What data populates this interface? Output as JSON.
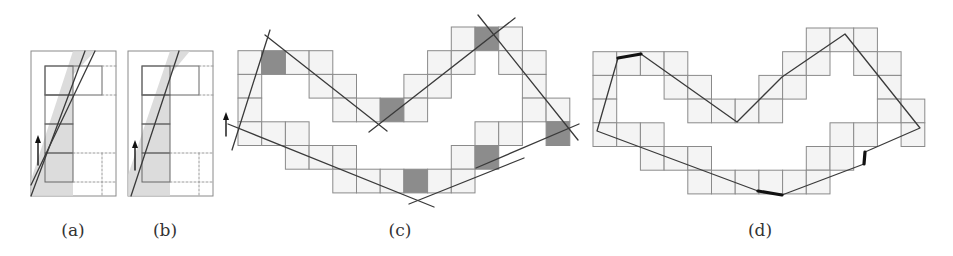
{
  "figure": {
    "colors": {
      "grid_line": "#8a8a8a",
      "cell_fill": "#f4f4f4",
      "dark_cell": "#8c8c8c",
      "shade_band": "#d6d6d6",
      "line": "#3a3a3a",
      "thick": "#111111",
      "dashed": "#9a9a9a"
    },
    "panels": [
      {
        "id": "a",
        "label": "(a)",
        "label_x": 73,
        "box": [
          31,
          51,
          85,
          145
        ],
        "col": [
          45,
          73
        ],
        "rows": [
          66,
          95,
          124,
          153,
          182
        ],
        "top_rect_right": 102,
        "band": [
          [
            31,
            196
          ],
          [
            73,
            196
          ],
          [
            73,
            75
          ],
          [
            95,
            51
          ],
          [
            73,
            51
          ],
          [
            31,
            180
          ]
        ],
        "lines": [
          [
            31,
            196,
            85,
            51
          ],
          [
            31,
            185,
            95,
            51
          ]
        ],
        "arrow": [
          38,
          165,
          38,
          135
        ]
      },
      {
        "id": "b",
        "label": "(b)",
        "label_x": 165,
        "box": [
          128,
          51,
          85,
          145
        ],
        "col": [
          142,
          170
        ],
        "rows": [
          66,
          95,
          124,
          153,
          182
        ],
        "top_rect_right": 199,
        "band": [
          [
            128,
            196
          ],
          [
            170,
            196
          ],
          [
            170,
            75
          ],
          [
            190,
            51
          ],
          [
            170,
            51
          ],
          [
            128,
            175
          ]
        ],
        "lines": [
          [
            131,
            196,
            179,
            51
          ]
        ],
        "arrow": [
          135,
          170,
          135,
          140
        ]
      },
      {
        "id": "c",
        "label": "(c)",
        "label_x": 400,
        "origin": [
          238,
          27
        ],
        "lines": [
          [
            265,
            35,
            387,
            131
          ],
          [
            369,
            132,
            515,
            18
          ],
          [
            478,
            15,
            578,
            140
          ],
          [
            476,
            168,
            579,
            124
          ],
          [
            409,
            204,
            524,
            158
          ],
          [
            228,
            124,
            434,
            207
          ],
          [
            232,
            150,
            270,
            30
          ]
        ],
        "arrow": [
          226,
          136,
          226,
          112
        ]
      },
      {
        "id": "d",
        "label": "(d)",
        "label_x": 760,
        "origin": [
          593,
          28
        ],
        "polyline": [
          [
            618,
            58
          ],
          [
            597,
            131
          ],
          [
            758,
            191
          ]
        ],
        "polyline2": [
          [
            782,
            195
          ],
          [
            864,
            164
          ]
        ],
        "polyline3": [
          [
            865,
            152
          ],
          [
            920,
            128
          ],
          [
            845,
            34
          ],
          [
            782,
            77
          ],
          [
            737,
            122
          ],
          [
            641,
            54
          ]
        ],
        "thick_segments": [
          [
            618,
            58,
            641,
            54
          ],
          [
            758,
            191,
            782,
            195
          ],
          [
            864,
            164,
            865,
            152
          ]
        ]
      }
    ],
    "grid": {
      "cell": 23.7,
      "cells": [
        [
          0,
          9
        ],
        [
          0,
          10,
          "d"
        ],
        [
          0,
          11
        ],
        [
          1,
          0
        ],
        [
          1,
          1,
          "d"
        ],
        [
          1,
          2
        ],
        [
          1,
          3
        ],
        [
          1,
          8
        ],
        [
          1,
          9
        ],
        [
          1,
          11
        ],
        [
          1,
          12
        ],
        [
          2,
          0
        ],
        [
          2,
          3
        ],
        [
          2,
          4
        ],
        [
          2,
          7
        ],
        [
          2,
          8
        ],
        [
          2,
          12
        ],
        [
          3,
          0
        ],
        [
          3,
          4
        ],
        [
          3,
          5
        ],
        [
          3,
          6,
          "d"
        ],
        [
          3,
          7
        ],
        [
          3,
          12
        ],
        [
          3,
          13
        ],
        [
          4,
          0
        ],
        [
          4,
          1
        ],
        [
          4,
          2
        ],
        [
          4,
          10
        ],
        [
          4,
          11
        ],
        [
          4,
          13,
          "d"
        ],
        [
          5,
          2
        ],
        [
          5,
          3
        ],
        [
          5,
          4
        ],
        [
          5,
          9
        ],
        [
          5,
          10,
          "d"
        ],
        [
          6,
          4
        ],
        [
          6,
          5
        ],
        [
          6,
          6
        ],
        [
          6,
          7,
          "d"
        ],
        [
          6,
          8
        ],
        [
          6,
          9
        ]
      ]
    }
  }
}
